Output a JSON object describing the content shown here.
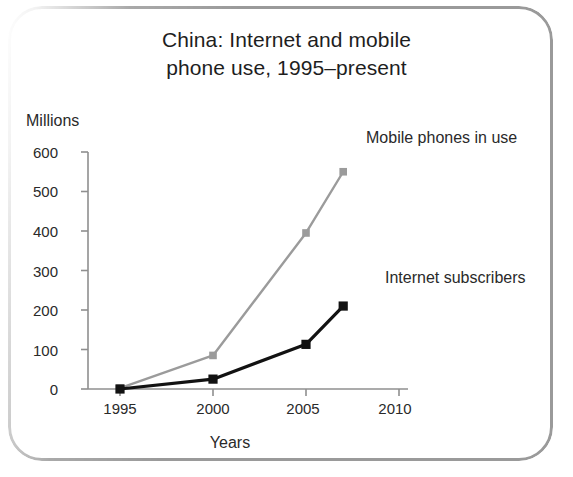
{
  "chart_data": {
    "type": "line",
    "title": "China: Internet and mobile phone use, 1995–present",
    "title_line1": "China: Internet and mobile",
    "title_line2": "phone use, 1995–present",
    "xlabel": "Years",
    "ylabel": "Millions",
    "ylim": [
      0,
      600
    ],
    "xlim": [
      1994,
      2011
    ],
    "grid": false,
    "legend_position": "inline-right",
    "ytick_labels": [
      "600",
      "500",
      "400",
      "300",
      "200",
      "100",
      "0"
    ],
    "ytick_values": [
      600,
      500,
      400,
      300,
      200,
      100,
      0
    ],
    "xtick_labels": [
      "1995",
      "2000",
      "2005",
      "2010"
    ],
    "xtick_values": [
      1995,
      2000,
      2005,
      2010
    ],
    "x": [
      1995,
      2000,
      2005,
      2007
    ],
    "series": [
      {
        "name": "Mobile phones in use",
        "color": "#9b9b9b",
        "marker": "square",
        "values": [
          2,
          85,
          395,
          550
        ]
      },
      {
        "name": "Internet subscribers",
        "color": "#121212",
        "marker": "square",
        "values": [
          0,
          25,
          113,
          210
        ]
      }
    ],
    "annotations": [
      {
        "text": "Mobile phones in use",
        "series": "Mobile phones in use"
      },
      {
        "text": "Internet subscribers",
        "series": "Internet subscribers"
      }
    ],
    "colors": {
      "axis": "#8f8f8f",
      "text": "#2a2a2a",
      "frame": "#9a9a9a",
      "background": "#ffffff"
    }
  }
}
